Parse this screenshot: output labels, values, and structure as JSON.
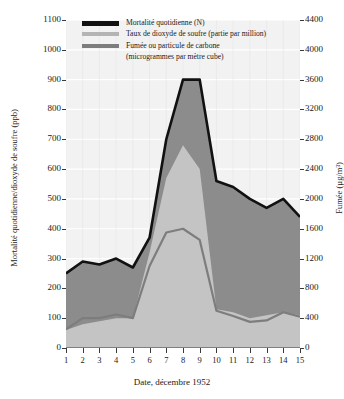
{
  "chart_data": {
    "type": "area",
    "title": "",
    "xlabel": "Date, décembre 1952",
    "ylabel": "Mortalité quotidienne/dioxyde de soufre (ppb)",
    "ylabel_right": "Fumée (µg/m³)",
    "ylim": [
      0,
      1100
    ],
    "ylim_right": [
      0,
      4400
    ],
    "yticks": [
      0,
      100,
      200,
      300,
      400,
      500,
      600,
      700,
      800,
      900,
      1000,
      1100
    ],
    "yticks_right": [
      0,
      400,
      800,
      1200,
      1600,
      2000,
      2400,
      2800,
      3200,
      3600,
      4000,
      4400
    ],
    "grid": true,
    "legend_position": "top-center",
    "categories": [
      1,
      2,
      3,
      4,
      5,
      6,
      7,
      8,
      9,
      10,
      11,
      12,
      13,
      14,
      15
    ],
    "xticks": [
      "1",
      "2",
      "3",
      "4",
      "5",
      "6",
      "7",
      "8",
      "9",
      "10",
      "11",
      "12",
      "13",
      "14",
      "15"
    ],
    "series": [
      {
        "name": "Mortalité quotidienne (N)",
        "axis": "left",
        "unit": "N",
        "color": "#1a1a1a",
        "values": [
          250,
          290,
          280,
          300,
          270,
          370,
          700,
          900,
          900,
          560,
          540,
          500,
          470,
          500,
          440
        ]
      },
      {
        "name": "Taux de dioxyde de soufre (partie par million)",
        "axis": "left",
        "unit": "ppb",
        "color": "#b4b4b4",
        "values": [
          60,
          80,
          90,
          100,
          100,
          320,
          570,
          680,
          600,
          130,
          120,
          100,
          110,
          120,
          110
        ]
      },
      {
        "name": "Fumée ou particule de carbone (microgrammes par mètre cube)",
        "axis": "right",
        "unit": "µg/m³",
        "color": "#7d7d7d",
        "values": [
          250,
          400,
          400,
          450,
          400,
          1100,
          1550,
          1600,
          1450,
          500,
          430,
          350,
          370,
          480,
          420
        ]
      }
    ]
  },
  "legend": {
    "items": [
      {
        "label": "Mortalité quotidienne (N)",
        "sub": "",
        "color": "#1a1a1a"
      },
      {
        "label": "Taux de dioxyde de soufre (partie par million)",
        "sub": "",
        "color": "#b4b4b4"
      },
      {
        "label": "Fumée ou particule de carbone",
        "sub": "(microgrammes par mètre cube)",
        "color": "#7d7d7d"
      }
    ]
  },
  "axes": {
    "left_title": "Mortalité quotidienne/dioxyde de soufre (ppb)",
    "right_title": "Fumée (µg/m³)",
    "x_title": "Date, décembre 1952"
  },
  "colors": {
    "mortality_band": "#8c8c8c",
    "so2_band": "#c4c4c4",
    "smoke_line": "#7d7d7d",
    "mortality_line": "#111111",
    "plot_bg": "#f2f2f2",
    "grid": "#ffffff"
  }
}
